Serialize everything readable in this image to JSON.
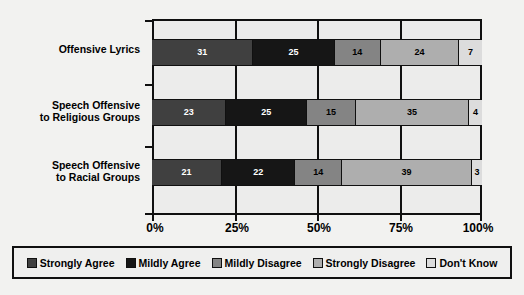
{
  "chart_data": {
    "type": "bar",
    "orientation": "horizontal",
    "stacked": true,
    "normalized_percent": true,
    "title": "",
    "xlabel": "",
    "ylabel": "",
    "xlim": [
      0,
      100
    ],
    "grid": true,
    "gridlines_at": [
      0,
      25,
      50,
      75,
      100
    ],
    "legend_position": "bottom",
    "categories": [
      "Offensive Lyrics",
      "Speech Offensive\nto Religious Groups",
      "Speech Offensive\nto Racial Groups"
    ],
    "series": [
      {
        "name": "Strongly Agree",
        "color": "#404040",
        "text_color": "#ffffff",
        "values": [
          31,
          23,
          21
        ]
      },
      {
        "name": "Mildly Agree",
        "color": "#161616",
        "text_color": "#ffffff",
        "values": [
          25,
          25,
          22
        ]
      },
      {
        "name": "Mildly Disagree",
        "color": "#848484",
        "text_color": "#000000",
        "values": [
          14,
          15,
          14
        ]
      },
      {
        "name": "Strongly Disagree",
        "color": "#aeaeae",
        "text_color": "#000000",
        "values": [
          24,
          35,
          39
        ]
      },
      {
        "name": "Don't Know",
        "color": "#dcdcdc",
        "text_color": "#000000",
        "values": [
          7,
          4,
          3
        ]
      }
    ],
    "x_tick_labels": [
      "0%",
      "25%",
      "50%",
      "75%",
      "100%"
    ],
    "x_tick_values": [
      0,
      25,
      50,
      75,
      100
    ]
  },
  "axis": {
    "ticks": [
      "0%",
      "25%",
      "50%",
      "75%",
      "100%"
    ]
  },
  "legend": {
    "items": [
      {
        "label": "Strongly Agree"
      },
      {
        "label": "Mildly Agree"
      },
      {
        "label": "Mildly Disagree"
      },
      {
        "label": "Strongly Disagree"
      },
      {
        "label": "Don't Know"
      }
    ]
  },
  "colors": {
    "strongly_agree": "#404040",
    "mildly_agree": "#161616",
    "mildly_disagree": "#848484",
    "strongly_disagree": "#aeaeae",
    "dont_know": "#dcdcdc",
    "axis": "#101010",
    "plot_background": "#ececeb",
    "page_background": "#f2f2f0"
  }
}
